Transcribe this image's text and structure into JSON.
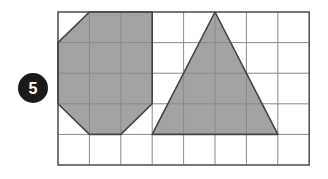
{
  "problem": {
    "number": "5",
    "badge_color": "#1a1a1a"
  },
  "grid": {
    "columns": 8,
    "rows": 5,
    "origin": [
      58,
      12
    ],
    "cell_width": 31.4,
    "cell_height": 30.6,
    "line_color": "#8a8a8a",
    "border_color": "#555555"
  },
  "shapes": [
    {
      "name": "octagon",
      "fill": "#a3a3a3",
      "stroke": "#444444",
      "vertices_grid": [
        [
          1,
          0
        ],
        [
          3,
          0
        ],
        [
          3,
          0
        ],
        [
          3,
          1
        ],
        [
          3,
          3
        ],
        [
          2,
          4
        ],
        [
          1,
          4
        ],
        [
          0,
          3
        ],
        [
          0,
          1
        ]
      ]
    },
    {
      "name": "triangle",
      "fill": "#a3a3a3",
      "stroke": "#444444",
      "vertices_grid": [
        [
          5,
          0
        ],
        [
          7,
          4
        ],
        [
          3,
          4
        ]
      ]
    }
  ]
}
